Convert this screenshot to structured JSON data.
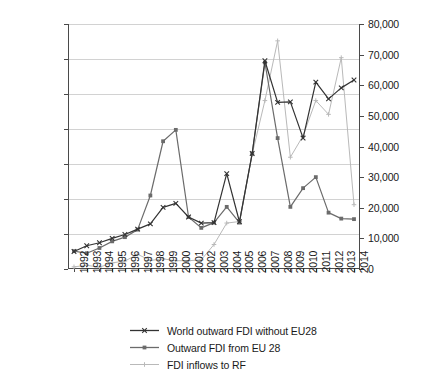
{
  "chart_data": {
    "type": "line",
    "title": "",
    "xlabel": "",
    "ylabel": "",
    "grid": true,
    "legend_position": "bottom",
    "categories": [
      "1992",
      "1993",
      "1994",
      "1995",
      "1996",
      "1997",
      "1998",
      "1999",
      "2000",
      "2001",
      "2002",
      "2003",
      "2004",
      "2005",
      "2006",
      "2007",
      "2008",
      "2009",
      "2010",
      "2011",
      "2012",
      "2013",
      "2014"
    ],
    "axes": {
      "left": {
        "label": "",
        "min": 0,
        "max": 1400000,
        "step": 200000,
        "ticks": [
          "0",
          "200,000",
          "400,000",
          "600,000",
          "800,000",
          "1,000,000",
          "1,200,000",
          "1,400,000"
        ]
      },
      "right": {
        "label": "",
        "min": 0,
        "max": 80000,
        "step": 10000,
        "ticks": [
          "0",
          "10,000",
          "20,000",
          "30,000",
          "40,000",
          "50,000",
          "60,000",
          "70,000",
          "80,000"
        ]
      }
    },
    "series": [
      {
        "name": "World outward FDI without EU28",
        "axis": "left",
        "color": "#333333",
        "marker": "x",
        "values": [
          100000,
          133000,
          150000,
          175000,
          197000,
          228000,
          258000,
          352000,
          375000,
          297000,
          262000,
          265000,
          545000,
          270000,
          660000,
          1190000,
          952000,
          955000,
          748000,
          1068000,
          972000,
          1035000,
          1080000
        ]
      },
      {
        "name": "Outward FDI from EU 28",
        "axis": "left",
        "color": "#6b6b6b",
        "marker": "square",
        "values": [
          102000,
          90000,
          120000,
          158000,
          182000,
          225000,
          420000,
          730000,
          795000,
          297000,
          235000,
          265000,
          355000,
          265000,
          660000,
          1180000,
          748000,
          355000,
          462000,
          525000,
          322000,
          288000,
          285000
        ]
      },
      {
        "name": "FDI inflows to RF",
        "axis": "right",
        "color": "#b9b9b9",
        "marker": "plus",
        "values": [
          700,
          1200,
          600,
          2000,
          2600,
          4800,
          2800,
          3300,
          2700,
          2700,
          3000,
          8000,
          15000,
          15500,
          37500,
          55000,
          74500,
          36500,
          43500,
          55000,
          50500,
          69000,
          21000
        ]
      }
    ]
  },
  "legend": {
    "items": [
      {
        "label": "World outward FDI without EU28",
        "color": "#333333",
        "marker": "x"
      },
      {
        "label": "Outward FDI from EU 28",
        "color": "#6b6b6b",
        "marker": "square"
      },
      {
        "label": "FDI inflows to RF",
        "color": "#b9b9b9",
        "marker": "plus"
      }
    ]
  }
}
